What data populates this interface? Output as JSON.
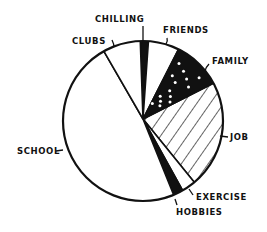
{
  "chart_data": {
    "type": "pie",
    "title": "",
    "start_angle_deg": -2,
    "direction": "clockwise",
    "slices": [
      {
        "label": "CHILLING",
        "percent": 1.7,
        "degrees": 6,
        "fill": "black"
      },
      {
        "label": "FRIENDS",
        "percent": 6.4,
        "degrees": 23,
        "fill": "white"
      },
      {
        "label": "FAMILY",
        "percent": 10.0,
        "degrees": 36,
        "fill": "black-dotted"
      },
      {
        "label": "JOB",
        "percent": 21.7,
        "degrees": 78,
        "fill": "hatched"
      },
      {
        "label": "EXERCISE",
        "percent": 2.8,
        "degrees": 10,
        "fill": "white"
      },
      {
        "label": "HOBBIES",
        "percent": 1.9,
        "degrees": 7,
        "fill": "black"
      },
      {
        "label": "SCHOOL",
        "percent": 47.8,
        "degrees": 172,
        "fill": "white"
      },
      {
        "label": "CLUBS",
        "percent": 7.8,
        "degrees": 28,
        "fill": "white"
      }
    ],
    "categories": [
      "CHILLING",
      "FRIENDS",
      "FAMILY",
      "JOB",
      "EXERCISE",
      "HOBBIES",
      "SCHOOL",
      "CLUBS"
    ],
    "values": [
      1.7,
      6.4,
      10.0,
      21.7,
      2.8,
      1.9,
      47.8,
      7.8
    ],
    "legend": "none (labels placed outside pie with leader ticks)",
    "style": "hand-drawn black and white"
  },
  "labels": {
    "chilling": "CHILLING",
    "friends": "FRIENDS",
    "family": "FAMILY",
    "job": "JOB",
    "exercise": "EXERCISE",
    "hobbies": "HOBBIES",
    "school": "SCHOOL",
    "clubs": "CLUBS"
  }
}
